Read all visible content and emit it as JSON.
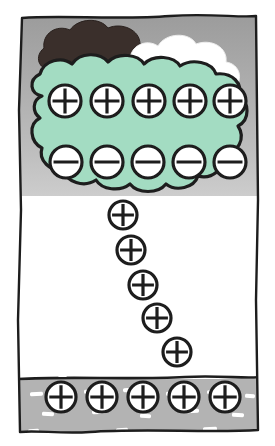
{
  "figure": {
    "canvas": {
      "width": 275,
      "height": 446
    },
    "colors": {
      "sky_top": "#9a9a9a",
      "sky_bottom": "#ffffff",
      "ground": "#b3b3b3",
      "ground_dash": "#ffffff",
      "cloud_charged": "#a3dcc2",
      "cloud_dark": "#3a2f2b",
      "cloud_white": "#ffffff",
      "ink": "#1d1d1d",
      "charge_fill": "#ffffff",
      "frame": "#1d1d1d"
    },
    "ground_line_y": 378,
    "sky_gradient_end_y": 200
  },
  "legend": {
    "positive_symbol": "+",
    "negative_symbol": "−"
  },
  "clouds": [
    {
      "name": "dark-cloud",
      "label": "dark storm cloud",
      "fill": "#3a2f2b"
    },
    {
      "name": "white-cloud",
      "label": "white cloud top",
      "fill": "#ffffff"
    },
    {
      "name": "charged-cloud",
      "label": "charged cloud body",
      "fill": "#a3dcc2"
    }
  ],
  "charge_groups": [
    {
      "name": "cloud-positive-row",
      "label": "Positive charges at cloud top",
      "sign": "+",
      "count": 5,
      "radius": 16,
      "charges": [
        {
          "sign": "+",
          "cx": 65,
          "cy": 101,
          "r": 16
        },
        {
          "sign": "+",
          "cx": 107,
          "cy": 101,
          "r": 16
        },
        {
          "sign": "+",
          "cx": 149,
          "cy": 101,
          "r": 16
        },
        {
          "sign": "+",
          "cx": 190,
          "cy": 101,
          "r": 16
        },
        {
          "sign": "+",
          "cx": 230,
          "cy": 101,
          "r": 16
        }
      ]
    },
    {
      "name": "cloud-negative-row",
      "label": "Negative charges at cloud base",
      "sign": "−",
      "count": 5,
      "radius": 16,
      "charges": [
        {
          "sign": "−",
          "cx": 66,
          "cy": 162,
          "r": 16
        },
        {
          "sign": "−",
          "cx": 107,
          "cy": 162,
          "r": 16
        },
        {
          "sign": "−",
          "cx": 148,
          "cy": 162,
          "r": 16
        },
        {
          "sign": "−",
          "cx": 189,
          "cy": 162,
          "r": 16
        },
        {
          "sign": "−",
          "cx": 230,
          "cy": 162,
          "r": 16
        }
      ]
    },
    {
      "name": "positive-streamer",
      "label": "Upward positive streamer",
      "sign": "+",
      "count": 6,
      "radius": 14,
      "charges": [
        {
          "sign": "+",
          "cx": 123,
          "cy": 215,
          "r": 14
        },
        {
          "sign": "+",
          "cx": 131,
          "cy": 250,
          "r": 14
        },
        {
          "sign": "+",
          "cx": 143,
          "cy": 285,
          "r": 14
        },
        {
          "sign": "+",
          "cx": 157,
          "cy": 318,
          "r": 14
        },
        {
          "sign": "+",
          "cx": 177,
          "cy": 352,
          "r": 14
        },
        {
          "sign": "+",
          "cx": 167,
          "cy": 318,
          "r": 0
        }
      ]
    },
    {
      "name": "ground-positive-row",
      "label": "Induced positive charges on ground",
      "sign": "+",
      "count": 5,
      "radius": 15,
      "charges": [
        {
          "sign": "+",
          "cx": 61,
          "cy": 397,
          "r": 15
        },
        {
          "sign": "+",
          "cx": 102,
          "cy": 397,
          "r": 15
        },
        {
          "sign": "+",
          "cx": 143,
          "cy": 397,
          "r": 15
        },
        {
          "sign": "+",
          "cx": 184,
          "cy": 397,
          "r": 15
        },
        {
          "sign": "+",
          "cx": 225,
          "cy": 397,
          "r": 15
        }
      ]
    }
  ],
  "ground_dashes": [
    {
      "x": 30,
      "y": 392,
      "w": 13,
      "h": 4,
      "rot": -4
    },
    {
      "x": 84,
      "y": 390,
      "w": 11,
      "h": 4,
      "rot": 2
    },
    {
      "x": 123,
      "y": 388,
      "w": 10,
      "h": 4,
      "rot": -3
    },
    {
      "x": 166,
      "y": 392,
      "w": 11,
      "h": 4,
      "rot": 3
    },
    {
      "x": 207,
      "y": 390,
      "w": 12,
      "h": 4,
      "rot": -2
    },
    {
      "x": 245,
      "y": 394,
      "w": 10,
      "h": 4,
      "rot": 4
    },
    {
      "x": 42,
      "y": 412,
      "w": 12,
      "h": 4,
      "rot": 3
    },
    {
      "x": 92,
      "y": 410,
      "w": 14,
      "h": 4,
      "rot": -3
    },
    {
      "x": 140,
      "y": 414,
      "w": 11,
      "h": 4,
      "rot": 2
    },
    {
      "x": 186,
      "y": 409,
      "w": 13,
      "h": 4,
      "rot": -4
    },
    {
      "x": 232,
      "y": 413,
      "w": 12,
      "h": 4,
      "rot": 3
    },
    {
      "x": 28,
      "y": 429,
      "w": 11,
      "h": 4,
      "rot": -2
    },
    {
      "x": 70,
      "y": 432,
      "w": 13,
      "h": 4,
      "rot": 3
    },
    {
      "x": 116,
      "y": 428,
      "w": 12,
      "h": 4,
      "rot": -3
    },
    {
      "x": 160,
      "y": 431,
      "w": 11,
      "h": 4,
      "rot": 2
    },
    {
      "x": 203,
      "y": 427,
      "w": 14,
      "h": 4,
      "rot": -3
    },
    {
      "x": 244,
      "y": 431,
      "w": 10,
      "h": 4,
      "rot": 4
    },
    {
      "x": 58,
      "y": 374,
      "w": 9,
      "h": 3,
      "rot": 0
    }
  ]
}
